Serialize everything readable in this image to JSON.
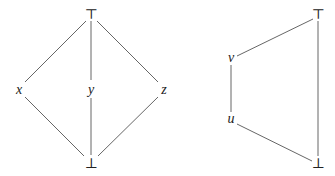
{
  "diagrams": [
    {
      "name": "lattice-m3",
      "nodes": [
        {
          "id": "top",
          "label": "⊤",
          "x": 91,
          "y": 14,
          "italic": false
        },
        {
          "id": "x",
          "label": "x",
          "x": 19,
          "y": 89,
          "italic": true
        },
        {
          "id": "y",
          "label": "y",
          "x": 91,
          "y": 89,
          "italic": true
        },
        {
          "id": "z",
          "label": "z",
          "x": 164,
          "y": 89,
          "italic": true
        },
        {
          "id": "bot",
          "label": "⊥",
          "x": 91,
          "y": 163,
          "italic": false
        }
      ],
      "edges": [
        {
          "from": "top",
          "to": "x"
        },
        {
          "from": "top",
          "to": "y"
        },
        {
          "from": "top",
          "to": "z"
        },
        {
          "from": "x",
          "to": "bot"
        },
        {
          "from": "y",
          "to": "bot"
        },
        {
          "from": "z",
          "to": "bot"
        }
      ]
    },
    {
      "name": "lattice-n5",
      "nodes": [
        {
          "id": "top",
          "label": "⊤",
          "x": 318,
          "y": 14,
          "italic": false
        },
        {
          "id": "v",
          "label": "v",
          "x": 231,
          "y": 58,
          "italic": true
        },
        {
          "id": "u",
          "label": "u",
          "x": 231,
          "y": 119,
          "italic": true
        },
        {
          "id": "bot",
          "label": "⊥",
          "x": 318,
          "y": 163,
          "italic": false
        }
      ],
      "edges": [
        {
          "from": "top",
          "to": "v"
        },
        {
          "from": "v",
          "to": "u"
        },
        {
          "from": "u",
          "to": "bot"
        },
        {
          "from": "top",
          "to": "bot"
        }
      ]
    }
  ]
}
